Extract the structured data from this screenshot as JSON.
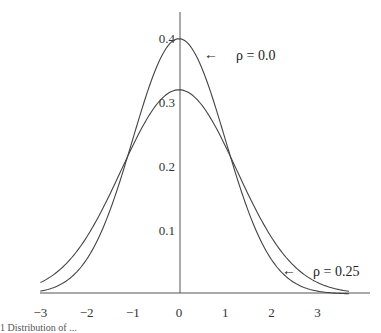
{
  "chart_data": {
    "type": "line",
    "title": "",
    "xlabel": "",
    "ylabel": "",
    "xlim": [
      -3.0,
      3.8
    ],
    "ylim": [
      0,
      0.45
    ],
    "grid": false,
    "legend": "inline arrow annotations",
    "x_ticks": [
      "−3",
      "−2",
      "−1",
      "0",
      "1",
      "2",
      "3"
    ],
    "x_tick_values": [
      -3,
      -2,
      -1,
      0,
      1,
      2,
      3
    ],
    "y_ticks": [
      "0.1",
      "0.2",
      "0.3",
      "0.4"
    ],
    "y_tick_values": [
      0.1,
      0.2,
      0.3,
      0.4
    ],
    "series": [
      {
        "name": "ρ = 0.0",
        "sigma": 1.0,
        "peak": 0.4,
        "x": [
          -3,
          -2,
          -1,
          0,
          1,
          2,
          3
        ],
        "values": [
          0.004,
          0.054,
          0.242,
          0.399,
          0.242,
          0.054,
          0.004
        ]
      },
      {
        "name": "ρ = 0.25",
        "sigma": 1.25,
        "peak": 0.32,
        "x": [
          -3,
          -2,
          -1,
          0,
          1,
          2,
          3
        ],
        "values": [
          0.018,
          0.089,
          0.232,
          0.319,
          0.232,
          0.089,
          0.018
        ]
      }
    ],
    "annotations": [
      {
        "text": "ρ = 0.0",
        "arrow": "←",
        "points_to": "peak of rho 0.0 curve"
      },
      {
        "text": "ρ = 0.25",
        "arrow": "←",
        "points_to": "right tail of rho 0.25 curve"
      }
    ]
  },
  "labels": {
    "ann_rho0": "ρ = 0.0",
    "ann_rho25": "ρ = 0.25",
    "arrow": "←",
    "caption": "1   Distribution of ..."
  }
}
